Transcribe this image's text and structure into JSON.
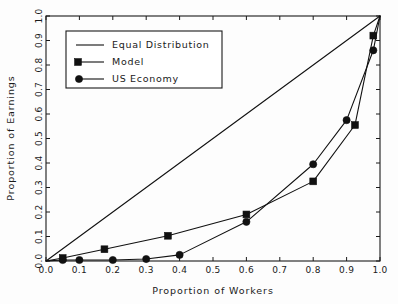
{
  "chart_data": {
    "type": "line",
    "title": "",
    "xlabel": "Proportion of Workers",
    "ylabel": "Proportion of Earnings",
    "xlim": [
      0.0,
      1.0
    ],
    "ylim": [
      0.0,
      1.0
    ],
    "grid": false,
    "legend_position": "upper left",
    "xticks": [
      "0.0",
      "0.1",
      "0.2",
      "0.3",
      "0.4",
      "0.5",
      "0.6",
      "0.7",
      "0.8",
      "0.9",
      "1.0"
    ],
    "xtick_values": [
      0.0,
      0.1,
      0.2,
      0.3,
      0.4,
      0.5,
      0.6,
      0.7,
      0.8,
      0.9,
      1.0
    ],
    "yticks": [
      "0.0",
      "0.1",
      "0.2",
      "0.3",
      "0.4",
      "0.5",
      "0.6",
      "0.7",
      "0.8",
      "0.9",
      "1.0"
    ],
    "ytick_values": [
      0.0,
      0.1,
      0.2,
      0.3,
      0.4,
      0.5,
      0.6,
      0.7,
      0.8,
      0.9,
      1.0
    ],
    "series": [
      {
        "name": "Equal Distribution",
        "marker": "none",
        "color": "#111111",
        "x": [
          0.0,
          1.0
        ],
        "y": [
          0.0,
          1.0
        ]
      },
      {
        "name": "Model",
        "marker": "square",
        "color": "#111111",
        "x": [
          0.0,
          0.05,
          0.175,
          0.365,
          0.6,
          0.8,
          0.925,
          0.98,
          1.0
        ],
        "y": [
          0.0,
          0.012,
          0.048,
          0.103,
          0.19,
          0.325,
          0.555,
          0.92,
          1.0
        ]
      },
      {
        "name": "US Economy",
        "marker": "circle",
        "color": "#111111",
        "x": [
          0.0,
          0.05,
          0.1,
          0.2,
          0.3,
          0.4,
          0.6,
          0.8,
          0.9,
          0.98,
          1.0
        ],
        "y": [
          0.0,
          0.004,
          0.004,
          0.004,
          0.008,
          0.025,
          0.16,
          0.395,
          0.575,
          0.86,
          1.0
        ]
      }
    ]
  },
  "legend": {
    "entries": [
      {
        "label": "Equal Distribution",
        "marker": "none"
      },
      {
        "label": "Model",
        "marker": "square"
      },
      {
        "label": "US Economy",
        "marker": "circle"
      }
    ]
  },
  "colors": {
    "ink": "#111111",
    "background": "#fdfdfd"
  }
}
